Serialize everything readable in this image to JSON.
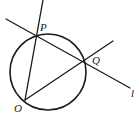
{
  "diagram": {
    "type": "geometry",
    "background": "#ffffff",
    "stroke_color": "#1a1a1a",
    "circle": {
      "cx": 48,
      "cy": 72,
      "r": 38
    },
    "points": {
      "P": {
        "x": 36,
        "y": 36
      },
      "Q": {
        "x": 83,
        "y": 62
      },
      "O": {
        "x": 25,
        "y": 100
      }
    },
    "lines": [
      {
        "name": "line-OP",
        "from": [
          25,
          100
        ],
        "to": [
          43,
          0
        ]
      },
      {
        "name": "line-l",
        "from": [
          6,
          19
        ],
        "to": [
          130,
          88
        ]
      },
      {
        "name": "line-OQ",
        "from": [
          25,
          100
        ],
        "to": [
          113,
          41
        ]
      }
    ],
    "labels": {
      "P": "P",
      "Q": "Q",
      "O": "O",
      "l": "l"
    }
  }
}
